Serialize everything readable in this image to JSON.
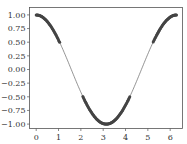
{
  "chart_data": {
    "type": "line",
    "title": "",
    "xlabel": "",
    "ylabel": "",
    "function": "cos(x)",
    "xlim": [
      -0.314,
      6.597
    ],
    "ylim": [
      -1.1,
      1.1
    ],
    "grid": false,
    "legend": null,
    "x_ticks": [
      0,
      1,
      2,
      3,
      4,
      5,
      6
    ],
    "x_tick_labels": [
      "0",
      "1",
      "2",
      "3",
      "4",
      "5",
      "6"
    ],
    "y_ticks": [
      1.0,
      0.75,
      0.5,
      0.25,
      0.0,
      -0.25,
      -0.5,
      -0.75,
      -1.0
    ],
    "y_tick_labels": [
      "1.00",
      "0.75",
      "0.50",
      "0.25",
      "0.00",
      "−0.25",
      "−0.50",
      "−0.75",
      "−1.00"
    ],
    "series": [
      {
        "name": "cos line",
        "style": "thin line",
        "color": "#555555",
        "x_range": [
          0,
          6.283
        ],
        "x": [
          0,
          0.5,
          1.0,
          1.5,
          2.0,
          2.5,
          3.0,
          3.1416,
          3.5,
          4.0,
          4.5,
          5.0,
          5.5,
          6.0,
          6.283
        ],
        "y": [
          1.0,
          0.878,
          0.54,
          0.071,
          -0.416,
          -0.801,
          -0.99,
          -1.0,
          -0.936,
          -0.654,
          -0.211,
          0.284,
          0.709,
          0.96,
          1.0
        ]
      },
      {
        "name": "markers where |cos(x)| >= 0.5",
        "style": "dense dot markers",
        "color": "#444444",
        "segments": [
          {
            "x_range": [
              0,
              1.05
            ],
            "y_range": [
              0.5,
              1.0
            ]
          },
          {
            "x_range": [
              2.09,
              4.19
            ],
            "y_range": [
              -1.0,
              -0.5
            ]
          },
          {
            "x_range": [
              5.24,
              6.283
            ],
            "y_range": [
              0.5,
              1.0
            ]
          }
        ]
      }
    ]
  }
}
